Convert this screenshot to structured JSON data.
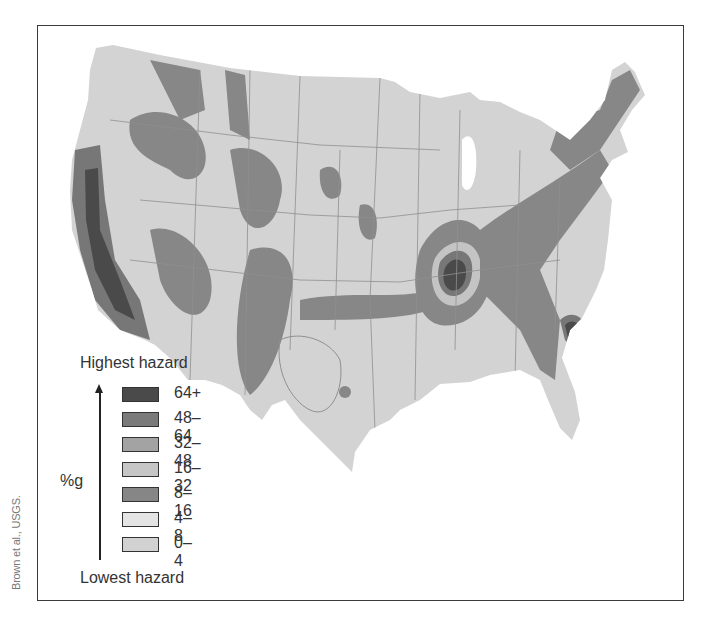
{
  "figure": {
    "credit": "Brown et al., USGS."
  },
  "legend": {
    "top_label": "Highest hazard",
    "bottom_label": "Lowest hazard",
    "unit_label": "%g",
    "items": [
      {
        "label": "64+",
        "color": "#4a4a4a"
      },
      {
        "label": "48–64",
        "color": "#7a7a7a"
      },
      {
        "label": "32–48",
        "color": "#a3a3a3"
      },
      {
        "label": "16–32",
        "color": "#c6c6c6"
      },
      {
        "label": "8–16",
        "color": "#868686"
      },
      {
        "label": "4–8",
        "color": "#e4e4e4"
      },
      {
        "label": "0–4",
        "color": "#d2d2d2"
      }
    ]
  },
  "colors": {
    "base": "#d3d3d3",
    "band_8_16": "#878787",
    "band_16_32": "#c4c4c4",
    "band_32_48": "#a2a2a2",
    "band_48_64": "#777777",
    "band_64_plus": "#4a4a4a",
    "borders": "#8f8f8f",
    "frame": "#3a3a3a"
  }
}
